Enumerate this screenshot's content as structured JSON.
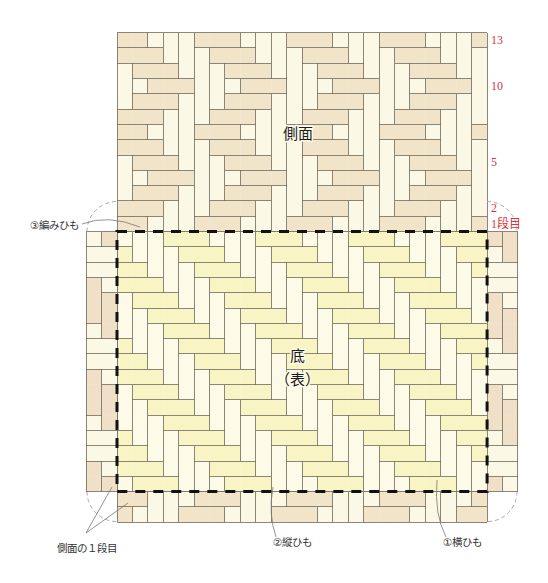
{
  "diagram": {
    "side_title": "側面",
    "base_title": "底",
    "base_subtitle": "（表）"
  },
  "row_labels": {
    "row13": "13",
    "row10": "10",
    "row5": "5",
    "row2": "2",
    "row1": "1段目"
  },
  "callouts": {
    "weaving_strip": "③編みひも",
    "side_first_row": "側面の１段目",
    "vertical_strip": "②縦ひも",
    "horizontal_strip": "①横ひも"
  },
  "colors": {
    "side_horizontal": "#f2e4c9",
    "side_vertical": "#fcf8e6",
    "base_horizontal": "#f9f4c3",
    "base_vertical": "#fdfbe8",
    "label_red": "#d8323a",
    "outline": "#111111"
  },
  "weave": {
    "cell_w": 15.42,
    "cell_h": 15.3,
    "regions": [
      {
        "name": "side-panel-weave",
        "x": 117,
        "y": 32.6,
        "colors": {
          "H": "#f2e4c9",
          "V": "#fcf8e6"
        },
        "rows": [
          "HHVVVHHHVVVHHHVVVHHHVVVH",
          "HHHVVVHHHVVVHHHVVVHHHVVV",
          "VHHHVVVHHHVVVHHHVVVHHHVV",
          "VVHHHVVVHHHVVVHHHVVVHHHV",
          "VHHHVVVHHHVVVHHHVVVHHHVV",
          "HHHVVVHHHVVVHHHVVVHHHVVV",
          "HHVVVHHHVVVHHHVVVHHHVVVH",
          "HHHVVVHHHVVVHHHVVVHHHVVV",
          "VHHHVVVHHHVVVHHHVVVHHHVV",
          "VVHHHVVVHHHVVVHHHVVVHHHV",
          "VHHHVVVHHHVVVHHHVVVHHHVV",
          "HHHVVVHHHVVVHHHVVVHHHVVV",
          "HHVVVHHHVVVHHHVVVHHHVVVH"
        ]
      },
      {
        "name": "base-weave",
        "x": 117,
        "y": 231.5,
        "colors": {
          "H": "#f9f4c3",
          "V": "#fdfbe8"
        },
        "rows": [
          "VVVHHHVVVHHHVVVHHHVVVHHH",
          "HVVVHHHVVVHHHVVVHHHVVVHH",
          "HHVVVHHHVVVHHHVVVHHHVVVH",
          "HHHVVVHHHVVVHHHVVVHHHVVV",
          "VHHHVVVHHHVVVHHHVVVHHHVV",
          "VVHHHVVVHHHVVVHHHVVVHHHV",
          "VVVHHHVVVHHHVVVHHHVVVHHH",
          "HVVVHHHVVVHHHVVVHHHVVVHH",
          "HHVVVHHHVVVHHHVVVHHHVVVH",
          "HHHVVVHHHVVVHHHVVVHHHVVV",
          "VHHHVVVHHHVVVHHHVVVHHHVV",
          "VVHHHVVVHHHVVVHHHVVVHHHV",
          "VVVHHHVVVHHHVVVHHHVVVHHH",
          "HVVVHHHVVVHHHVVVHHHVVVHH",
          "HHVVVHHHVVVHHHVVVHHHVVVH",
          "HHHVVVHHHVVVHHHVVVHHHVVV",
          "VHHHVVVHHHVVVHHHVVVHHHVV"
        ]
      },
      {
        "name": "bottom-side-strip",
        "x": 117,
        "y": 491.6,
        "colors": {
          "H": "#f2e4c9",
          "V": "#fcf8e6"
        },
        "rows": [
          "HHVVVHHHVVVHHHVVVHHHVVVH",
          "HVVVHHHVVVHHHVVVHHHVVVHH"
        ]
      },
      {
        "name": "left-side-strip",
        "x": 86.16,
        "y": 231.5,
        "colors": {
          "H": "#fcf8e6",
          "V": "#f1e0c8"
        },
        "rows": [
          "HV",
          "HH",
          "HH",
          "VH",
          "VV",
          "VV",
          "HV",
          "HH",
          "HH",
          "VH",
          "VV",
          "VV",
          "HV",
          "HH",
          "HH",
          "VH",
          "VV"
        ]
      },
      {
        "name": "right-side-strip",
        "x": 487.08,
        "y": 231.5,
        "colors": {
          "H": "#fcf8e6",
          "V": "#f1e0c8"
        },
        "rows": [
          "VV",
          "HV",
          "HH",
          "HH",
          "VH",
          "VV",
          "VV",
          "HV",
          "HH",
          "HH",
          "VH",
          "VV",
          "VV",
          "HV",
          "HH",
          "HH",
          "VH"
        ]
      }
    ]
  }
}
